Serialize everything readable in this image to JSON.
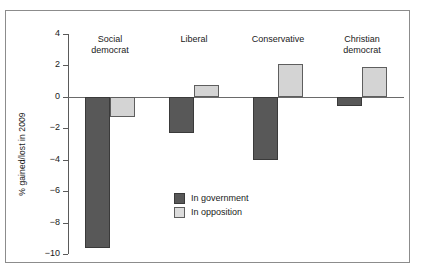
{
  "chart_data": {
    "type": "bar",
    "title": "",
    "xlabel": "",
    "ylabel": "% gained/lost in 2009",
    "categories": [
      "Social democrat",
      "Liberal",
      "Conservative",
      "Christian democrat"
    ],
    "category_lines": [
      [
        "Social",
        "democrat"
      ],
      [
        "Liberal"
      ],
      [
        "Conservative"
      ],
      [
        "Christian",
        "democrat"
      ]
    ],
    "series": [
      {
        "name": "In government",
        "color": "#585858",
        "values": [
          -9.6,
          -2.3,
          -4.0,
          -0.6
        ]
      },
      {
        "name": "In opposition",
        "color": "#d4d4d4",
        "values": [
          -1.3,
          0.75,
          2.1,
          1.9
        ]
      }
    ],
    "ylim": [
      -10,
      4
    ],
    "yticks": [
      4,
      2,
      0,
      -2,
      -4,
      -6,
      -8,
      -10
    ],
    "ytick_labels": [
      "4",
      "2",
      "0",
      "-2",
      "-4",
      "-6",
      "-8",
      "-10"
    ],
    "grid": false,
    "legend_position": "center",
    "zero_line": 0
  },
  "legend": {
    "items": [
      {
        "label": "In government",
        "swatch": "dark-gray-swatch"
      },
      {
        "label": "In opposition",
        "swatch": "light-gray-swatch"
      }
    ]
  },
  "colors": {
    "in_government": "#585858",
    "in_opposition": "#d4d4d4",
    "axis": "#5a5a5a",
    "frame": "#8c8c8c",
    "text": "#1a1a1a",
    "background": "#ffffff"
  }
}
